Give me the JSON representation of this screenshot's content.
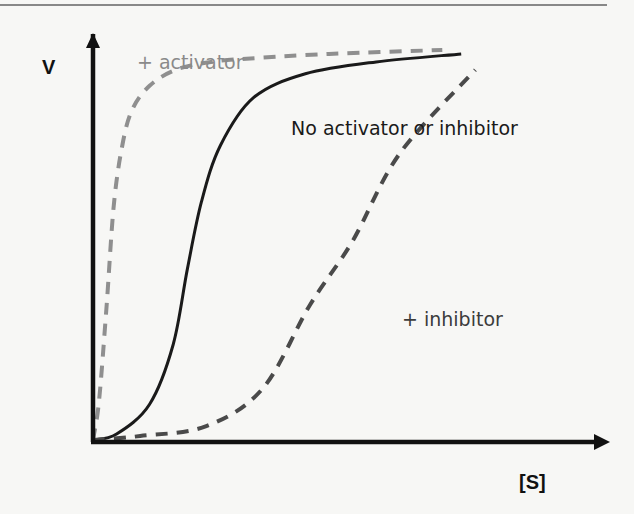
{
  "chart_data": {
    "type": "line",
    "title": "",
    "xlabel": "[S]",
    "ylabel": "V",
    "xlim": [
      0,
      10
    ],
    "ylim": [
      0,
      10
    ],
    "grid": false,
    "legend": "inline annotations",
    "series": [
      {
        "name": "+ activator",
        "style": "dashed",
        "color": "#8f8f8f",
        "x": [
          0,
          0.13,
          0.29,
          0.44,
          0.62,
          0.83,
          1.2,
          1.75,
          2.5,
          3.5,
          5.0,
          7.4
        ],
        "y": [
          0,
          1.0,
          3.4,
          5.9,
          7.4,
          8.3,
          8.9,
          9.3,
          9.5,
          9.6,
          9.7,
          9.8
        ]
      },
      {
        "name": "No activator or inhibitor",
        "style": "solid",
        "color": "#1a1a1a",
        "x": [
          0,
          0.5,
          1.2,
          1.7,
          2.0,
          2.3,
          2.7,
          3.4,
          4.5,
          6.0,
          7.8
        ],
        "y": [
          0,
          0.15,
          0.9,
          2.4,
          4.3,
          6.0,
          7.4,
          8.6,
          9.2,
          9.5,
          9.7
        ]
      },
      {
        "name": "+ inhibitor",
        "style": "dashed",
        "color": "#4a4a4a",
        "x": [
          0,
          1.0,
          2.4,
          3.6,
          4.6,
          5.5,
          6.5,
          8.1
        ],
        "y": [
          0,
          0.1,
          0.35,
          1.3,
          3.4,
          5.0,
          7.2,
          9.3
        ]
      }
    ],
    "annotations": [
      {
        "text": "+ activator",
        "series": "+ activator"
      },
      {
        "text": "No activator or inhibitor",
        "series": "No activator or inhibitor"
      },
      {
        "text": "+ inhibitor",
        "series": "+ inhibitor"
      }
    ]
  },
  "labels": {
    "y_axis": "V",
    "x_axis": "[S]",
    "activator": "+ activator",
    "normal": "No activator or inhibitor",
    "inhibitor": "+ inhibitor"
  }
}
